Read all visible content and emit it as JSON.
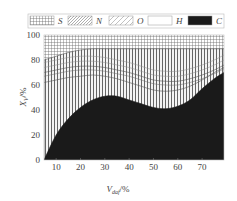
{
  "chart_data": {
    "type": "area",
    "title": "",
    "xlabel": "V_daf/%",
    "ylabel": "X_V/%",
    "xlim": [
      5,
      79
    ],
    "ylim": [
      0,
      100
    ],
    "x_ticks": [
      10,
      20,
      30,
      40,
      50,
      60,
      70
    ],
    "y_ticks": [
      0,
      20,
      40,
      60,
      80,
      100
    ],
    "legend": {
      "position": "top",
      "entries": [
        {
          "label": "S",
          "pattern": "grid"
        },
        {
          "label": "N",
          "pattern": "dense-diagonal"
        },
        {
          "label": "O",
          "pattern": "sparse-diagonal"
        },
        {
          "label": "H",
          "pattern": "blank"
        },
        {
          "label": "C",
          "pattern": "solid-black"
        }
      ]
    },
    "x": [
      5,
      10,
      15,
      20,
      25,
      30,
      35,
      40,
      45,
      50,
      55,
      60,
      65,
      70,
      75,
      79
    ],
    "series": [
      {
        "name": "C",
        "values": [
          0,
          20,
          33,
          42,
          48,
          51,
          51,
          48,
          45,
          42,
          41,
          43,
          48,
          57,
          65,
          70
        ]
      },
      {
        "name": "H",
        "values": [
          62,
          64,
          66,
          67,
          68,
          67,
          65,
          62,
          59,
          56,
          55,
          56,
          59,
          64,
          70,
          74
        ]
      },
      {
        "name": "O",
        "values": [
          70,
          72,
          74,
          75,
          75,
          74,
          72,
          70,
          67,
          64,
          63,
          63,
          65,
          68,
          72,
          76
        ]
      },
      {
        "name": "N",
        "values": [
          80,
          83,
          86,
          88,
          89,
          89,
          89,
          89,
          89,
          89,
          89,
          89,
          89,
          89,
          89,
          89
        ]
      },
      {
        "name": "S",
        "values": [
          100,
          100,
          100,
          100,
          100,
          100,
          100,
          100,
          100,
          100,
          100,
          100,
          100,
          100,
          100,
          100
        ]
      }
    ],
    "stacking": "cumulative boundaries (upper edge of each component band)",
    "grid": false
  },
  "labels": {
    "xlabel_main": "V",
    "xlabel_sub": "daf",
    "xlabel_unit": "/%",
    "ylabel_main": "X",
    "ylabel_sub": "V",
    "ylabel_unit": "/%"
  }
}
